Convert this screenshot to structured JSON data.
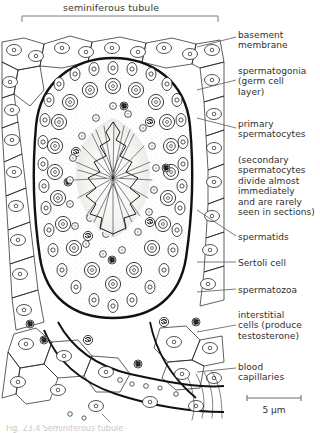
{
  "figure": {
    "type": "histology-line-drawing",
    "top_label": "seminiferous tubule",
    "scale_bar": {
      "value": "5",
      "unit": "µm",
      "text": "5 µm"
    },
    "caption": "Fig. 23.4   Seminiferous tubule",
    "colors": {
      "ink": "#1b1b1b",
      "text": "#2f2f2f",
      "leader": "#5a5a5a",
      "stipple": "#d9d6d2",
      "background": "#ffffff"
    }
  },
  "labels": [
    {
      "id": "basement-membrane",
      "text": "basement\nmembrane",
      "top": 30,
      "leader_y": 37,
      "target_y": 47
    },
    {
      "id": "spermatogonia",
      "text": "spermatogonia\n(germ cell\nlayer)",
      "top": 66,
      "leader_y": 80,
      "target_y": 90
    },
    {
      "id": "primary-spermatocytes",
      "text": "primary\nspermatocytes",
      "top": 119,
      "leader_y": 128,
      "target_y": 118
    },
    {
      "id": "secondary-spermatocytes",
      "text": "(secondary\nspermatocytes\ndivide almost\nimmediately\nand are rarely\nseen in sections)",
      "top": 155,
      "leader_y": 0,
      "target_y": 0
    },
    {
      "id": "spermatids",
      "text": "spermatids",
      "top": 232,
      "leader_y": 236,
      "target_y": 210
    },
    {
      "id": "sertoli-cell",
      "text": "Sertoli cell",
      "top": 258,
      "leader_y": 262,
      "target_y": 262
    },
    {
      "id": "spermatozoa",
      "text": "spermatozoa",
      "top": 285,
      "leader_y": 289,
      "target_y": 292
    },
    {
      "id": "interstitial-cells",
      "text": "interstitial\ncells (produce\ntestosterone)",
      "top": 310,
      "leader_y": 325,
      "target_y": 332
    },
    {
      "id": "blood-capillaries",
      "text": "blood\ncapillaries",
      "top": 362,
      "leader_y": 368,
      "target_y": 372
    }
  ]
}
